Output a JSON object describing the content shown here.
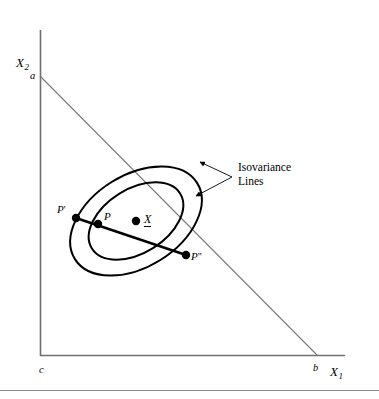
{
  "figure": {
    "type": "diagram",
    "width": 379,
    "height": 399,
    "background": "#ffffff",
    "ink": "#000000",
    "axis_color": "#6f6f6f",
    "line_color": "#7a7a7a"
  },
  "axes": {
    "y_axis_label": "X",
    "y_axis_subscript": "2",
    "x_axis_label": "X",
    "x_axis_subscript": "1",
    "origin_label": "c",
    "y_intercept_label": "a",
    "x_intercept_label": "b"
  },
  "points": [
    {
      "id": "p-prime",
      "label": "P",
      "primes": "'",
      "x": 76,
      "y": 218
    },
    {
      "id": "p",
      "label": "P",
      "primes": "",
      "x": 98,
      "y": 224
    },
    {
      "id": "p-dprime",
      "label": "P",
      "primes": "\"",
      "x": 186,
      "y": 255
    },
    {
      "id": "x-bar",
      "label": "X",
      "primes": "",
      "x": 136,
      "y": 221
    }
  ],
  "labels": {
    "p_prime": "P",
    "p_prime_marks": "'",
    "p": "P",
    "p_double_prime": "P",
    "p_double_prime_marks": "\"",
    "mean_vector": "X"
  },
  "annotation": {
    "line1": "Isovariance",
    "line2": "Lines"
  },
  "ellipses": {
    "center": [
      136,
      221
    ],
    "rotation_deg": -32,
    "outer": {
      "rx": 72,
      "ry": 46
    },
    "inner": {
      "rx": 52,
      "ry": 32
    }
  },
  "budget_line": {
    "from": [
      40,
      76
    ],
    "to": [
      318,
      356
    ],
    "from_label": "a",
    "to_label": "b"
  },
  "chord": {
    "from": [
      76,
      218
    ],
    "to": [
      186,
      255
    ]
  }
}
